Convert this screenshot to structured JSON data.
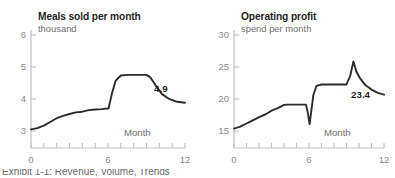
{
  "figure": {
    "background_color": "#ffffff",
    "line_color": "#2b2b2b",
    "axis_color": "#bfbfbf",
    "caption_partial": "Exhibit 1-1: Revenue, Volume, Trends"
  },
  "charts": [
    {
      "id": "meals-sold",
      "type": "line",
      "title": "Meals sold per month",
      "subtitle": "thousand",
      "xlabel": "Month",
      "ylabel": "",
      "xlim": [
        0,
        12
      ],
      "ylim": [
        3,
        6.35
      ],
      "yticks": [
        "3",
        "4",
        "5",
        "6"
      ],
      "ytick_values": [
        3,
        4,
        5,
        6
      ],
      "xticks": [
        "0",
        "6",
        "12"
      ],
      "xtick_values": [
        0,
        6,
        12
      ],
      "xminor_ticks": [
        0,
        1,
        2,
        3,
        4,
        5,
        6,
        7,
        8,
        9,
        10,
        11,
        12
      ],
      "grid": false,
      "legend": "none",
      "end_label": "4.9",
      "x": [
        0,
        0.5,
        1,
        1.5,
        2,
        2.5,
        3,
        3.5,
        4,
        4.5,
        5,
        5.5,
        5.95,
        6.05,
        6.3,
        6.6,
        7.0,
        7.6,
        8.4,
        9.0,
        9.3,
        9.7,
        10.2,
        10.8,
        11.4,
        12
      ],
      "values": [
        4.1,
        4.14,
        4.22,
        4.33,
        4.45,
        4.52,
        4.58,
        4.63,
        4.65,
        4.7,
        4.72,
        4.73,
        4.75,
        4.76,
        5.2,
        5.62,
        5.78,
        5.8,
        5.8,
        5.8,
        5.72,
        5.48,
        5.2,
        5.04,
        4.96,
        4.93
      ]
    },
    {
      "id": "operating-profit",
      "type": "line",
      "title": "Operating profit",
      "subtitle": "spend per month",
      "xlabel": "Month",
      "ylabel": "",
      "xlim": [
        0,
        12
      ],
      "ylim": [
        15,
        32.5
      ],
      "yticks": [
        "15",
        "20",
        "25",
        "30"
      ],
      "ytick_values": [
        15,
        20,
        25,
        30
      ],
      "xticks": [
        "0",
        "6",
        "12"
      ],
      "xtick_values": [
        0,
        6,
        12
      ],
      "xminor_ticks": [
        0,
        1,
        2,
        3,
        4,
        5,
        6,
        7,
        8,
        9,
        10,
        11,
        12
      ],
      "grid": false,
      "legend": "none",
      "end_label": "23.4",
      "x": [
        0,
        0.5,
        1,
        1.5,
        2,
        2.5,
        3,
        3.5,
        4,
        4.3,
        4.8,
        5.3,
        5.75,
        5.9,
        6.05,
        6.2,
        6.35,
        6.6,
        7.0,
        7.6,
        8.4,
        9.0,
        9.3,
        9.55,
        9.8,
        10.1,
        10.5,
        11.0,
        11.5,
        12
      ],
      "values": [
        18.5,
        18.8,
        19.3,
        19.8,
        20.3,
        20.7,
        21.3,
        21.7,
        22.2,
        22.25,
        22.25,
        22.25,
        22.25,
        21.0,
        19.2,
        21.5,
        23.8,
        25.2,
        25.4,
        25.4,
        25.4,
        25.4,
        26.8,
        29.0,
        27.4,
        26.3,
        25.3,
        24.6,
        24.1,
        23.8
      ]
    }
  ]
}
